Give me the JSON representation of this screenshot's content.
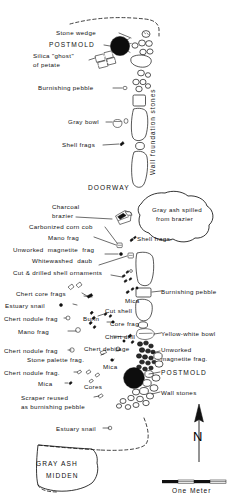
{
  "figure": {
    "type": "archaeological-plan-map",
    "title_visible": false
  },
  "labels": {
    "stone_wedge": "Stone wedge",
    "postmold_top": "POSTMOLD",
    "silica_ghost_l1": "Silica \"ghost\"",
    "silica_ghost_l2": "of petate",
    "burnishing_pebble_top": "Burnishing pebble",
    "gray_bowl": "Gray bowl",
    "shell_frags_left": "Shell frags",
    "wall_foundation_stones": "Wall foundation stones",
    "doorway": "DOORWAY",
    "charcoal_brazier_l1": "Charcoal",
    "charcoal_brazier_l2": "brazier",
    "gray_ash_spill_l1": "Gray ash spilled",
    "gray_ash_spill_l2": "from brazier",
    "carbonized_corn_cob": "Carbonized corn cob",
    "mano_frag_upper": "Mano frag",
    "shell_frags_right": "Shell frags.",
    "unworked_magnetite_frag_upper": "Unworked  magnetite  frag",
    "whitewashed_daub": "Whitewashed  daub",
    "cut_drilled_shell_ornaments": "Cut & drilled shell ornaments",
    "burnishing_pebble_mid": "Burnishing pebble",
    "mica_upper": "Mica",
    "chert_core_frags": "Chert core frags",
    "cut_shell": "Cut shell",
    "yellow_white_bowl": "Yellow-white bowl",
    "estuary_snail_mid": "Estuary snail",
    "chert_nodule_frag_1": "Chert nodule frag",
    "burin": "Burin",
    "core_frag": "Core frag",
    "mano_frag_lower": "Mano frag",
    "chert_drill": "Chert drill",
    "chert_nodule_frag_2": "Chert nodule frag",
    "chert_debitage": "Chert debitage",
    "unworked_magnetite_frag_lower_l1": "Unworked",
    "unworked_magnetite_frag_lower_l2": "magnetite frag.",
    "stone_palette_frag": "Stone palette frag.",
    "mica_mid": "Mica",
    "postmold_lower": "POSTMOLD",
    "chert_nodule_frag_3": "Chert nodule frag.",
    "mica_lower": "Mica",
    "cores": "Cores",
    "wall_stones": "Wall stones",
    "scraper_reused_l1": "Scraper reused",
    "scraper_reused_l2": "as burnishing pebble",
    "estuary_snail_lower": "Estuary snail",
    "gray_ash_midden_l1": "GRAY ASH",
    "gray_ash_midden_l2": "MIDDEN",
    "north": "N",
    "scale_caption": "One Meter"
  },
  "colors": {
    "ink": "#111111",
    "paper": "#ffffff",
    "fill_dark": "#0d0d0d",
    "stipple": "#9a9a9a"
  },
  "scale_bar": {
    "caption": "One Meter",
    "segments": 4
  },
  "compass": {
    "direction": "N"
  }
}
